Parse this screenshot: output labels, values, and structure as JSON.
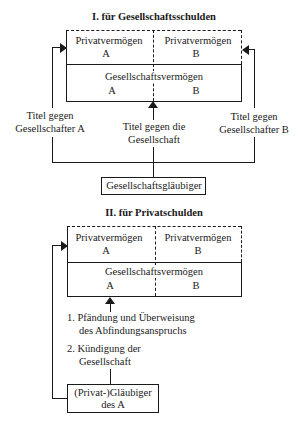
{
  "section1": {
    "title": "I. für Gesellschaftsschulden",
    "private_assets_a": {
      "label": "Privatvermögen",
      "owner": "A"
    },
    "private_assets_b": {
      "label": "Privatvermögen",
      "owner": "B"
    },
    "company_assets": {
      "label": "Gesellschaftsvermögen",
      "left": "A",
      "right": "B"
    },
    "title_against_a": [
      "Titel gegen",
      "Gesellschafter A"
    ],
    "title_against_company": [
      "Titel gegen die",
      "Gesellschaft"
    ],
    "title_against_b": [
      "Titel gegen",
      "Gesellschafter B"
    ],
    "creditor": "Gesellschaftsgläubiger"
  },
  "section2": {
    "title": "II. für Privatschulden",
    "private_assets_a": {
      "label": "Privatvermögen",
      "owner": "A"
    },
    "private_assets_b": {
      "label": "Privatvermögen",
      "owner": "B"
    },
    "company_assets": {
      "label": "Gesellschaftsvermögen",
      "left": "A",
      "right": "B"
    },
    "steps": [
      {
        "num": "1.",
        "lines": [
          "Pfändung und Überweisung",
          "des Abfindungsanspruchs"
        ]
      },
      {
        "num": "2.",
        "lines": [
          "Kündigung der",
          "Gesellschaft"
        ]
      }
    ],
    "creditor": [
      "(Privat-)Gläubiger",
      "des A"
    ]
  }
}
